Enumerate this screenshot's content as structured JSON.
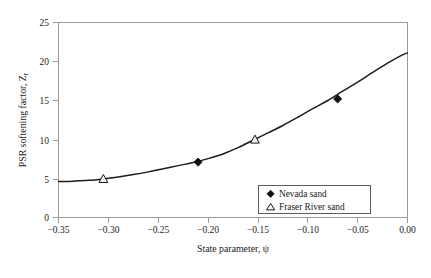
{
  "chart_data": {
    "type": "line",
    "title": "",
    "xlabel": "State parameter, ψ",
    "ylabel": "PSR softening factor, Z",
    "ylabel_sub": "r",
    "xlim": [
      -0.35,
      0.0
    ],
    "ylim": [
      0,
      25
    ],
    "grid": false,
    "legend_position": "inside-lower-right",
    "xticks": [
      "−0.35",
      "−0.30",
      "−0.25",
      "−0.20",
      "−0.15",
      "−0.10",
      "−0.05",
      "0.00"
    ],
    "xtick_values": [
      -0.35,
      -0.3,
      -0.25,
      -0.2,
      -0.15,
      -0.1,
      -0.05,
      0.0
    ],
    "yticks": [
      "0",
      "5",
      "10",
      "15",
      "20",
      "25"
    ],
    "ytick_values": [
      0,
      5,
      10,
      15,
      20,
      25
    ],
    "curve": {
      "name": "Fitted trend",
      "x": [
        -0.35,
        -0.335,
        -0.32,
        -0.305,
        -0.29,
        -0.275,
        -0.26,
        -0.245,
        -0.23,
        -0.215,
        -0.2,
        -0.185,
        -0.17,
        -0.155,
        -0.14,
        -0.125,
        -0.11,
        -0.095,
        -0.08,
        -0.065,
        -0.05,
        -0.035,
        -0.02,
        -0.005,
        0.0
      ],
      "y": [
        4.6,
        4.66,
        4.76,
        4.95,
        5.2,
        5.5,
        5.85,
        6.25,
        6.65,
        7.05,
        7.55,
        8.15,
        8.95,
        9.9,
        10.85,
        11.8,
        12.85,
        13.95,
        15.0,
        16.2,
        17.35,
        18.6,
        19.8,
        20.85,
        21.1
      ]
    },
    "series": [
      {
        "name": "Nevada sand",
        "marker": "filled-diamond",
        "color": "#111111",
        "points": [
          {
            "x": -0.21,
            "y": 7.1
          },
          {
            "x": -0.07,
            "y": 15.2
          }
        ]
      },
      {
        "name": "Fraser River sand",
        "marker": "open-triangle",
        "color": "#1a1a1a",
        "points": [
          {
            "x": -0.305,
            "y": 4.95
          },
          {
            "x": -0.153,
            "y": 10.0
          }
        ]
      }
    ],
    "legend": [
      {
        "label": "Nevada sand",
        "marker": "filled-diamond"
      },
      {
        "label": "Fraser River sand",
        "marker": "open-triangle"
      }
    ]
  }
}
